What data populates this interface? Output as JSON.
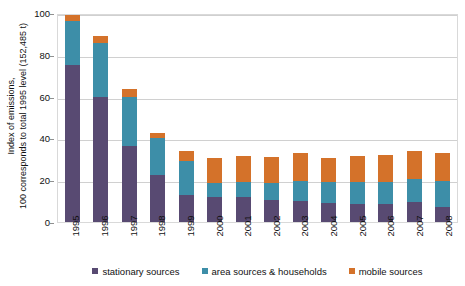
{
  "chart_data": {
    "type": "bar",
    "stacked": true,
    "title": "",
    "xlabel": "",
    "ylabel": "Index of emissions, 100 corresponds to total 1995 level (152,485 t)",
    "ylim": [
      0,
      100
    ],
    "yticks": [
      0,
      20,
      40,
      60,
      80,
      100
    ],
    "grid": true,
    "legend_position": "bottom",
    "categories": [
      "1995",
      "1996",
      "1997",
      "1998",
      "1999",
      "2000",
      "2001",
      "2002",
      "2003",
      "2004",
      "2005",
      "2006",
      "2007",
      "2008"
    ],
    "series": [
      {
        "name": "stationary sources",
        "color": "#584a72",
        "values": [
          76.0,
          59.8,
          36.5,
          22.5,
          13.0,
          12.2,
          11.8,
          10.5,
          10.2,
          9.0,
          8.8,
          8.5,
          9.8,
          7.0
        ]
      },
      {
        "name": "area sources & households",
        "color": "#3d8ea8",
        "values": [
          21.0,
          25.7,
          23.5,
          17.5,
          16.0,
          6.3,
          7.2,
          8.3,
          9.3,
          10.0,
          10.5,
          10.7,
          11.0,
          12.5
        ]
      },
      {
        "name": "mobile sources",
        "color": "#d4722a",
        "values": [
          3.0,
          3.5,
          3.5,
          2.5,
          5.0,
          12.0,
          12.5,
          12.2,
          13.5,
          11.5,
          12.2,
          12.8,
          13.2,
          13.5
        ]
      }
    ],
    "totals": [
      100.0,
      89.0,
      63.5,
      42.5,
      34.0,
      30.5,
      31.5,
      31.0,
      33.0,
      30.5,
      31.5,
      32.0,
      34.0,
      33.0
    ]
  },
  "axis": {
    "ylabel_line1": "Index of  emissions,",
    "ylabel_line2": "100 corresponds to total 1995 level (152,485 t)"
  },
  "legend": {
    "items": [
      {
        "label": "stationary sources",
        "color": "#584a72"
      },
      {
        "label": "area sources & households",
        "color": "#3d8ea8"
      },
      {
        "label": "mobile sources",
        "color": "#d4722a"
      }
    ]
  },
  "colors": {
    "stationary": "#584a72",
    "area": "#3d8ea8",
    "mobile": "#d4722a",
    "gridline": "#d0d0d0",
    "frame": "#d9d9d9",
    "background": "#ffffff"
  }
}
